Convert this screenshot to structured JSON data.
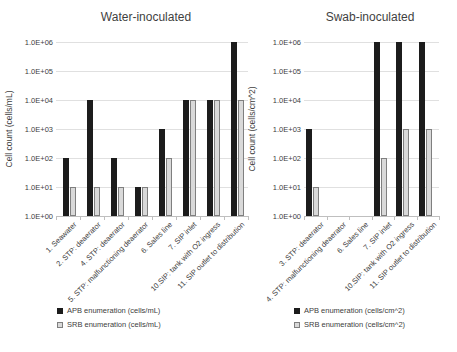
{
  "chart_data": [
    {
      "type": "bar",
      "title": "Water-inoculated",
      "ylabel": "Cell count (cells/mL)",
      "yscale": "log",
      "ylim": [
        1,
        1000000
      ],
      "yticks": [
        "1.0E+00",
        "1.0E+01",
        "1.0E+02",
        "1.0E+03",
        "1.0E+04",
        "1.0E+05",
        "1.0E+06"
      ],
      "grid": true,
      "legend_position": "bottom",
      "categories": [
        "1. Seawater",
        "2. STP: deaerator",
        "4. STP: deaerator",
        "5. STP: malfunctioning deaerator",
        "6. Sales line",
        "7. SIP inlet",
        "10.SIP: tank with O2 ingress",
        "11. SIP outlet to distribution"
      ],
      "series": [
        {
          "name": "APB enumeration (cells/mL)",
          "color": "#1c1c1c",
          "values": [
            100,
            10000,
            100,
            10,
            1000,
            10000,
            10000,
            1000000
          ]
        },
        {
          "name": "SRB enumeration (cells/mL)",
          "color": "#d9d9d9",
          "border": "#7f7f7f",
          "values": [
            10,
            10,
            10,
            10,
            100,
            10000,
            10000,
            10000
          ]
        }
      ]
    },
    {
      "type": "bar",
      "title": "Swab-inoculated",
      "ylabel": "Cell count (cells/cm^2)",
      "yscale": "log",
      "ylim": [
        1,
        1000000
      ],
      "yticks": [
        "1.0E+00",
        "1.0E+01",
        "1.0E+02",
        "1.0E+03",
        "1.0E+04",
        "1.0E+05",
        "1.0E+06"
      ],
      "grid": true,
      "legend_position": "bottom",
      "categories": [
        "3. STP: deaerator",
        "4. STP: malfunctioning deaerator",
        "6. Sales line",
        "7. SIP inlet",
        "10.SIP: tank with O2 ingress",
        "11. SIP outlet to distribution"
      ],
      "series": [
        {
          "name": "APB enumeration (cells/cm^2)",
          "color": "#1c1c1c",
          "values": [
            1000,
            null,
            null,
            1000000,
            1000000,
            1000000
          ]
        },
        {
          "name": "SRB enumeration (cells/cm^2)",
          "color": "#d9d9d9",
          "border": "#7f7f7f",
          "values": [
            10,
            null,
            null,
            100,
            1000,
            1000
          ]
        }
      ]
    }
  ],
  "colors": {
    "background": "#ffffff",
    "gridline": "#e0e0e0",
    "axis": "#bfbfbf",
    "text": "#404040",
    "title": "#3f3f3f",
    "apb_bar": "#1c1c1c",
    "srb_bar": "#d9d9d9"
  }
}
